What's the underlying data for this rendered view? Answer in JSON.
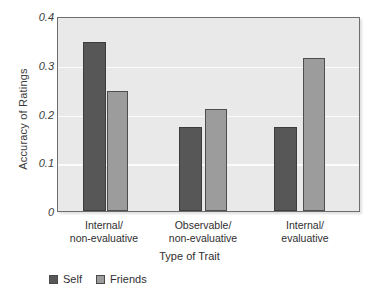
{
  "chart_data": {
    "type": "bar",
    "title": "",
    "xlabel": "Type of Trait",
    "ylabel": "Accuracy of Ratings",
    "categories": [
      "Internal/\nnon-evaluative",
      "Observable/\nnon-evaluative",
      "Internal/\nevaluative"
    ],
    "category_lines": [
      [
        "Internal/",
        "non-evaluative"
      ],
      [
        "Observable/",
        "non-evaluative"
      ],
      [
        "Internal/",
        "evaluative"
      ]
    ],
    "series": [
      {
        "name": "Self",
        "values": [
          0.35,
          0.175,
          0.175
        ],
        "color": "#575757"
      },
      {
        "name": "Friends",
        "values": [
          0.248,
          0.212,
          0.317
        ],
        "color": "#9c9c9c"
      }
    ],
    "ylim": [
      0,
      0.4
    ],
    "yticks": [
      0,
      0.1,
      0.2,
      0.3,
      0.4
    ],
    "ytick_labels": [
      "0",
      "0.1",
      "0.2",
      "0.3",
      "0.4"
    ],
    "gridlines": [
      0.1,
      0.2,
      0.3
    ],
    "grid": true,
    "grid_color": "#fbfbfb",
    "plot_background": "#e9e9e9",
    "legend_position": "below-left",
    "legend": [
      "Self",
      "Friends"
    ]
  },
  "axis": {
    "y_title": "Accuracy of Ratings",
    "x_title": "Type of Trait",
    "ytick_0": "0",
    "ytick_1": "0.1",
    "ytick_2": "0.2",
    "ytick_3": "0.3",
    "ytick_4": "0.4"
  },
  "xticks": [
    {
      "line1": "Internal/",
      "line2": "non-evaluative"
    },
    {
      "line1": "Observable/",
      "line2": "non-evaluative"
    },
    {
      "line1": "Internal/",
      "line2": "evaluative"
    }
  ],
  "legend": {
    "self_label": "Self",
    "friends_label": "Friends"
  }
}
